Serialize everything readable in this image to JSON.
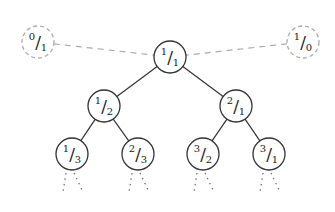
{
  "diagram": {
    "sentinels": [
      {
        "id": "left",
        "num": "0",
        "den": "1",
        "x": 38,
        "y": 42
      },
      {
        "id": "right",
        "num": "1",
        "den": "0",
        "x": 303,
        "y": 42
      }
    ],
    "nodes": [
      {
        "id": "n11",
        "num": "1",
        "den": "1",
        "x": 170,
        "y": 57
      },
      {
        "id": "n12",
        "num": "1",
        "den": "2",
        "x": 104,
        "y": 106
      },
      {
        "id": "n21",
        "num": "2",
        "den": "1",
        "x": 236,
        "y": 106
      },
      {
        "id": "n13",
        "num": "1",
        "den": "3",
        "x": 72,
        "y": 154
      },
      {
        "id": "n23",
        "num": "2",
        "den": "3",
        "x": 138,
        "y": 154
      },
      {
        "id": "n32",
        "num": "3",
        "den": "2",
        "x": 203,
        "y": 154
      },
      {
        "id": "n31",
        "num": "3",
        "den": "1",
        "x": 269,
        "y": 154
      }
    ],
    "edges": [
      [
        "n11",
        "n12"
      ],
      [
        "n11",
        "n21"
      ],
      [
        "n12",
        "n13"
      ],
      [
        "n12",
        "n23"
      ],
      [
        "n21",
        "n32"
      ],
      [
        "n21",
        "n31"
      ]
    ],
    "dashed_edges": [
      [
        "left",
        "n11"
      ],
      [
        "right",
        "n11"
      ]
    ],
    "colors": {
      "stroke": "#333333",
      "dashed": "#aaaaaa",
      "text": "#222222"
    }
  }
}
